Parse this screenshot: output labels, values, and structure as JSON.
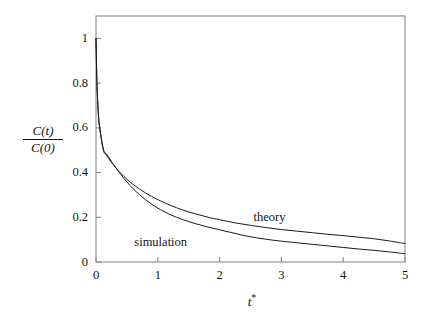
{
  "figure": {
    "background_color": "#ffffff",
    "frame_color": "#8a8a8a",
    "curve_color": "#1a1a1a"
  },
  "axes": {
    "x_label": "t",
    "x_label_superscript": "*",
    "y_label_numerator": "C(t)",
    "y_label_denominator": "C(0)",
    "x_ticks": [
      "0",
      "1",
      "2",
      "3",
      "4",
      "5"
    ],
    "y_ticks": [
      "0",
      "0.2",
      "0.4",
      "0.6",
      "0.8",
      "1"
    ]
  },
  "annotations": {
    "theory": "theory",
    "simulation": "simulation"
  },
  "chart_data": {
    "type": "line",
    "title": "",
    "xlabel": "t*",
    "ylabel": "C(t)/C(0)",
    "xlim": [
      0,
      5
    ],
    "ylim": [
      0,
      1.1
    ],
    "xticks": [
      0,
      1,
      2,
      3,
      4,
      5
    ],
    "yticks": [
      0,
      0.2,
      0.4,
      0.6,
      0.8,
      1
    ],
    "grid": false,
    "legend": "inline-annotations",
    "series": [
      {
        "name": "theory",
        "label_position": {
          "x": 2.55,
          "y": 0.195
        },
        "x": [
          0.0,
          0.01,
          0.02,
          0.04,
          0.06,
          0.09,
          0.12,
          0.15,
          0.2,
          0.25,
          0.3,
          0.4,
          0.5,
          0.6,
          0.7,
          0.8,
          0.9,
          1.0,
          1.2,
          1.4,
          1.6,
          1.8,
          2.0,
          2.25,
          2.5,
          2.75,
          3.0,
          3.25,
          3.5,
          3.75,
          4.0,
          4.25,
          4.5,
          4.75,
          5.0
        ],
        "y": [
          1.0,
          0.86,
          0.76,
          0.655,
          0.6,
          0.545,
          0.505,
          0.485,
          0.465,
          0.445,
          0.428,
          0.397,
          0.37,
          0.347,
          0.327,
          0.309,
          0.293,
          0.279,
          0.254,
          0.233,
          0.216,
          0.201,
          0.189,
          0.175,
          0.164,
          0.154,
          0.145,
          0.138,
          0.131,
          0.124,
          0.118,
          0.111,
          0.104,
          0.094,
          0.082
        ]
      },
      {
        "name": "simulation",
        "label_position": {
          "x": 0.62,
          "y": 0.085
        },
        "x": [
          0.0,
          0.01,
          0.02,
          0.04,
          0.06,
          0.09,
          0.12,
          0.14,
          0.16,
          0.2,
          0.25,
          0.3,
          0.4,
          0.5,
          0.6,
          0.7,
          0.8,
          0.9,
          1.0,
          1.2,
          1.4,
          1.6,
          1.8,
          2.0,
          2.2,
          2.4,
          2.6,
          2.8,
          3.0,
          3.25,
          3.5,
          3.75,
          4.0,
          4.25,
          4.5,
          4.75,
          5.0
        ],
        "y": [
          1.0,
          0.86,
          0.76,
          0.655,
          0.6,
          0.545,
          0.498,
          0.487,
          0.486,
          0.472,
          0.45,
          0.43,
          0.392,
          0.358,
          0.328,
          0.302,
          0.279,
          0.259,
          0.241,
          0.212,
          0.19,
          0.172,
          0.157,
          0.144,
          0.131,
          0.118,
          0.108,
          0.1,
          0.093,
          0.086,
          0.079,
          0.072,
          0.065,
          0.058,
          0.052,
          0.045,
          0.037
        ]
      }
    ]
  }
}
